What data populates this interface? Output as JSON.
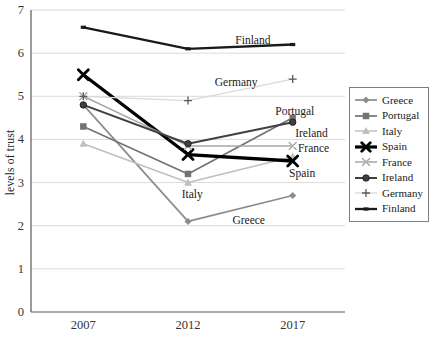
{
  "chart_data": {
    "type": "line",
    "title": "",
    "xlabel": "",
    "ylabel": "levels of trust",
    "categories": [
      "2007",
      "2012",
      "2017"
    ],
    "ylim": [
      0,
      7
    ],
    "ytick_step": 1,
    "yticks": [
      "0",
      "1",
      "2",
      "3",
      "4",
      "5",
      "6",
      "7"
    ],
    "grid": "horizontal",
    "legend_position": "right-box",
    "axis_color": "#595959",
    "grid_color": "#dbdbdb",
    "tick_label_color": "#333333",
    "annotation_color": "#1a1a1a",
    "series": [
      {
        "name": "Greece",
        "values": [
          4.8,
          2.1,
          2.7
        ],
        "color": "#8c8c8c",
        "marker": "diamond",
        "line_width": 1.7,
        "marker_size": 7
      },
      {
        "name": "Portugal",
        "values": [
          4.3,
          3.2,
          4.5
        ],
        "color": "#737373",
        "marker": "square",
        "line_width": 1.7,
        "marker_size": 6.5
      },
      {
        "name": "Italy",
        "values": [
          3.9,
          3.0,
          3.6
        ],
        "color": "#bfbfbf",
        "marker": "triangle",
        "line_width": 1.5,
        "marker_size": 7
      },
      {
        "name": "Spain",
        "values": [
          5.5,
          3.65,
          3.5
        ],
        "color": "#000000",
        "marker": "x",
        "line_width": 3.3,
        "marker_size": 10,
        "marker_stroke": 2.8
      },
      {
        "name": "France",
        "values": [
          5.0,
          3.85,
          3.85
        ],
        "color": "#a6a6a6",
        "marker": "x",
        "line_width": 1.5,
        "marker_size": 7,
        "marker_stroke": 1.4
      },
      {
        "name": "Ireland",
        "values": [
          4.8,
          3.9,
          4.4
        ],
        "color": "#404040",
        "marker": "circle",
        "line_width": 2.0,
        "marker_size": 6.5
      },
      {
        "name": "Germany",
        "values": [
          5.0,
          4.9,
          5.4
        ],
        "color": "#d9d9d9",
        "marker": "plus",
        "line_width": 1.3,
        "marker_size": 8,
        "marker_color": "#595959"
      },
      {
        "name": "Finland",
        "values": [
          6.6,
          6.1,
          6.2
        ],
        "color": "#1a1a1a",
        "marker": "dash",
        "line_width": 2.3,
        "marker_size": 5
      }
    ],
    "annotations": [
      {
        "text": "Finland",
        "x": 1.62,
        "y": 6.31
      },
      {
        "text": "Germany",
        "x": 1.46,
        "y": 5.34
      },
      {
        "text": "Portugal",
        "x": 2.02,
        "y": 4.66
      },
      {
        "text": "Ireland",
        "x": 2.18,
        "y": 4.16
      },
      {
        "text": "France",
        "x": 2.2,
        "y": 3.8
      },
      {
        "text": "Spain",
        "x": 2.09,
        "y": 3.23
      },
      {
        "text": "Italy",
        "x": 1.04,
        "y": 2.74
      },
      {
        "text": "Greece",
        "x": 1.58,
        "y": 2.13
      }
    ]
  }
}
